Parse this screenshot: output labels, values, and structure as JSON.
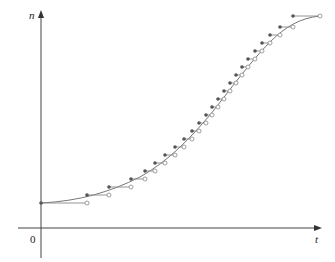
{
  "chart_data": {
    "type": "line",
    "title": "",
    "xlabel": "t",
    "ylabel": "n",
    "origin_label": "0",
    "grid": false,
    "legend": "none",
    "series": [
      {
        "name": "step-function",
        "style": "steps with closed-left / open-right endpoints",
        "steps": [
          {
            "x0": 41,
            "x1": 87,
            "y": 203
          },
          {
            "x0": 87,
            "x1": 109,
            "y": 195
          },
          {
            "x0": 109,
            "x1": 131,
            "y": 187
          },
          {
            "x0": 131,
            "x1": 145,
            "y": 179
          },
          {
            "x0": 145,
            "x1": 155,
            "y": 171
          },
          {
            "x0": 155,
            "x1": 165,
            "y": 163
          },
          {
            "x0": 165,
            "x1": 175,
            "y": 155
          },
          {
            "x0": 175,
            "x1": 184,
            "y": 147
          },
          {
            "x0": 184,
            "x1": 192,
            "y": 139
          },
          {
            "x0": 192,
            "x1": 199,
            "y": 131
          },
          {
            "x0": 199,
            "x1": 206,
            "y": 123
          },
          {
            "x0": 206,
            "x1": 212,
            "y": 115
          },
          {
            "x0": 212,
            "x1": 218,
            "y": 107
          },
          {
            "x0": 218,
            "x1": 224,
            "y": 99
          },
          {
            "x0": 224,
            "x1": 230,
            "y": 91
          },
          {
            "x0": 230,
            "x1": 236,
            "y": 83
          },
          {
            "x0": 236,
            "x1": 242,
            "y": 75
          },
          {
            "x0": 242,
            "x1": 248,
            "y": 67
          },
          {
            "x0": 248,
            "x1": 255,
            "y": 59
          },
          {
            "x0": 255,
            "x1": 262,
            "y": 51
          },
          {
            "x0": 262,
            "x1": 270,
            "y": 43
          },
          {
            "x0": 270,
            "x1": 280,
            "y": 35
          },
          {
            "x0": 280,
            "x1": 293,
            "y": 27
          },
          {
            "x0": 293,
            "x1": 320,
            "y": 16
          }
        ]
      },
      {
        "name": "logistic-curve",
        "style": "smooth curve",
        "path": "M41,203 C80,201 110,192 140,177 C170,160 190,138 210,115 C230,90 250,62 270,42 C285,27 300,18 320,16"
      }
    ],
    "colors": {
      "axis": "#444444",
      "curve": "#777777",
      "step": "#888888",
      "filled_dot": "#555555",
      "open_dot_stroke": "#888888"
    }
  }
}
